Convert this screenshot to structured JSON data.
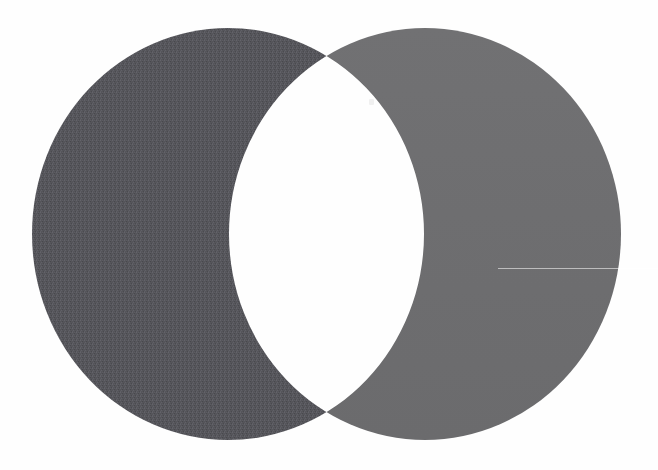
{
  "image": {
    "title": "Two overlapping circles forming a letter-O shape",
    "width": 658,
    "height": 470,
    "background_color": "#fefefe",
    "description": "Two large equal-radius filled circles overlap horizontally; their lens-shaped intersection is white, leaving two opposing crescents that together read as a capital letter O."
  },
  "chart_data": {
    "type": "diagram",
    "subtype": "venn-two-set-overlap",
    "title": "Two overlapping circles forming a letter-O shape",
    "xlabel": "",
    "ylabel": "",
    "grid": false,
    "legend_position": "none",
    "xlim": [
      0,
      658
    ],
    "ylim": [
      0,
      470
    ],
    "shapes": [
      {
        "name": "left-circle",
        "label": "Left circle (dark, textured)",
        "type": "circle",
        "cx": 228,
        "cy": 234,
        "rx": 196,
        "ry": 206,
        "fill": "#55555a",
        "texture": "dithered",
        "bounds": {
          "left": 32,
          "right": 424,
          "top": 28,
          "bottom": 440
        }
      },
      {
        "name": "right-circle",
        "label": "Right circle (light, smooth)",
        "type": "circle",
        "cx": 425,
        "cy": 234,
        "rx": 196,
        "ry": 206,
        "fill": "#6e6e70",
        "texture": "smooth",
        "bounds": {
          "left": 229,
          "right": 621,
          "top": 28,
          "bottom": 440
        }
      },
      {
        "name": "intersection-lens",
        "label": "Intersection (white lens)",
        "type": "lens",
        "fill": "#fefefe",
        "bounds": {
          "left": 229,
          "right": 424,
          "top": 38,
          "bottom": 428
        }
      }
    ],
    "intersection_points": [
      {
        "name": "top-cusp",
        "x": 335,
        "y": 38
      },
      {
        "name": "bottom-cusp",
        "x": 330,
        "y": 428
      }
    ],
    "artifacts": [
      {
        "name": "scanline-artifact",
        "label": "Faint horizontal scan line across right crescent",
        "x": 498,
        "y": 268,
        "width": 160,
        "color": "#f2f2f2"
      },
      {
        "name": "speck-artifact",
        "label": "Tiny faint speck in white lens region",
        "x": 369,
        "y": 99,
        "width": 5,
        "height": 6,
        "color": "#f0f0f0"
      }
    ]
  },
  "colors": {
    "dark_fill": "#55555a",
    "dark_fill_texture_light": "#63636a",
    "dark_fill_texture_dark": "#47474c",
    "light_fill": "#6e6e70",
    "background": "#fefefe",
    "lens_fill": "#fefefe"
  }
}
